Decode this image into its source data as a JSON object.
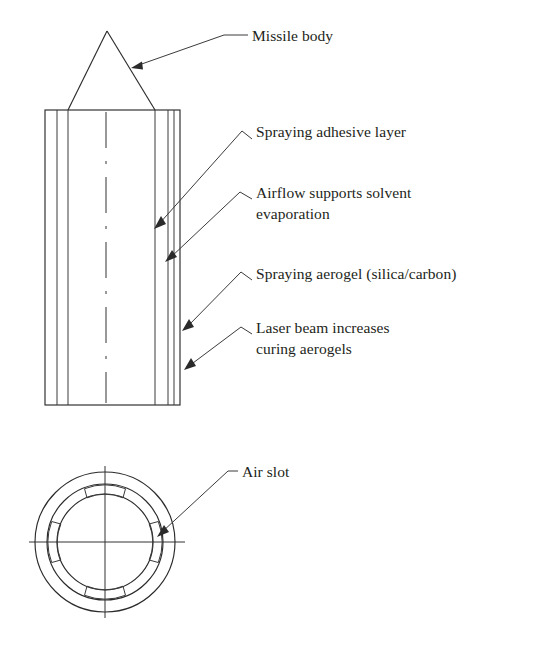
{
  "figure": {
    "background_color": "#ffffff",
    "line_color": "#2b2b2b",
    "text_color": "#231f20"
  },
  "callouts": [
    {
      "id": "missile-body",
      "text": "Missile body",
      "target": "nose cone right flank"
    },
    {
      "id": "spraying-adhesive-layer",
      "text": "Spraying adhesive layer",
      "target": "inner right wall of body"
    },
    {
      "id": "airflow-supports-solvent-evaporation",
      "text_line_1": "Airflow supports solvent",
      "text_line_2": "evaporation",
      "target": "second right wall of body"
    },
    {
      "id": "spraying-aerogel",
      "text": "Spraying aerogel (silica/carbon)",
      "target": "outer right wall of body"
    },
    {
      "id": "laser-beam-increases-curing-aerogels",
      "text_line_1": "Laser beam increases",
      "text_line_2": "curing aerogels",
      "target": "outer right edge of body"
    },
    {
      "id": "air-slot",
      "text": "Air slot",
      "target": "right slot of cross-section ring"
    }
  ],
  "views": {
    "side_view": {
      "name": "Longitudinal section of missile with spray nozzle annulus",
      "nose_cone": {
        "apex_x": 107,
        "apex_y": 31,
        "base_left_x": 68,
        "base_right_x": 155,
        "base_y": 110
      },
      "body": {
        "left": 45,
        "right": 180,
        "top": 110,
        "bottom": 405
      },
      "vertical_walls_x": [
        45,
        57,
        68,
        155,
        168,
        174,
        180
      ],
      "axis_centerline_x": 106
    },
    "cross_section_view": {
      "name": "Cross-section of annular spray head showing air slots",
      "center_x": 105,
      "center_y": 542,
      "radius_outer": 70,
      "radius_middle": 58,
      "radius_inner": 48,
      "slot_count": 4,
      "slot_positions_degrees": [
        0,
        90,
        180,
        270
      ]
    }
  }
}
